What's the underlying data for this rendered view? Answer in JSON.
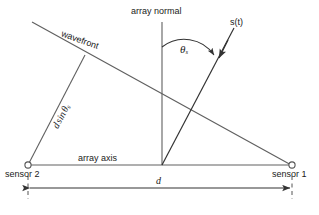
{
  "figure": {
    "type": "diagram",
    "background_color": "#ffffff",
    "line_color": "#555555",
    "text_color": "#1a1a1a"
  },
  "labels": {
    "array_normal": "array normal",
    "wavefront": "wavefront",
    "signal": "s(t)",
    "theta": "θ",
    "theta_subscript": "s",
    "path_difference_d": "d",
    "path_difference_sin": "sin",
    "array_axis": "array axis",
    "sensor_left": "sensor 2",
    "sensor_right": "sensor 1",
    "spacing": "d"
  },
  "geometry": {
    "sensor_left_point": [
      28,
      165
    ],
    "sensor_right_point": [
      292,
      165
    ],
    "array_center_point": [
      162,
      165
    ],
    "array_normal_top": [
      162,
      22
    ],
    "wavefront_start": [
      32,
      22
    ],
    "wavefront_end": [
      292,
      165
    ],
    "perpendicular_foot": [
      85,
      55
    ],
    "signal_arrow_start": [
      234,
      28
    ],
    "signal_line_end": [
      162,
      165
    ],
    "arc_start": [
      162,
      48
    ],
    "arc_end": [
      219,
      56
    ],
    "dimension_line_y": 187,
    "dimension_left_x": 28,
    "dimension_right_x": 292
  }
}
